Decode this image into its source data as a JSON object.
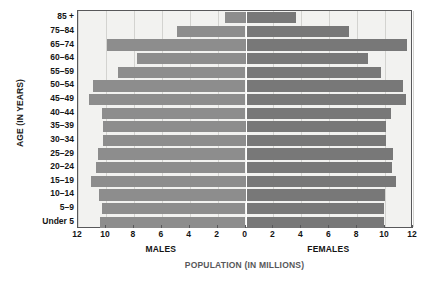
{
  "chart_data": {
    "type": "bar",
    "subtype": "population-pyramid",
    "title": "",
    "xlabel": "POPULATION (IN MILLIONS)",
    "ylabel": "AGE (IN YEARS)",
    "categories": [
      "85 +",
      "75–84",
      "65–74",
      "60–64",
      "55–59",
      "50–54",
      "45–49",
      "40–44",
      "35–39",
      "30–34",
      "25–29",
      "20–24",
      "15–19",
      "10–14",
      "5–9",
      "Under 5"
    ],
    "series": [
      {
        "name": "MALES",
        "direction": "left",
        "color": "#8d8d8d",
        "values": [
          1.5,
          4.9,
          9.9,
          7.8,
          9.1,
          10.9,
          11.2,
          10.3,
          10.2,
          10.2,
          10.6,
          10.7,
          11.1,
          10.5,
          10.3,
          10.4
        ]
      },
      {
        "name": "FEMALES",
        "direction": "right",
        "color": "#787878",
        "values": [
          3.6,
          7.4,
          11.6,
          8.8,
          9.7,
          11.3,
          11.5,
          10.4,
          10.1,
          10.1,
          10.6,
          10.5,
          10.8,
          10.0,
          9.9,
          9.9
        ]
      }
    ],
    "xticks": [
      12,
      10,
      8,
      6,
      4,
      2,
      0,
      2,
      4,
      6,
      8,
      10,
      12
    ],
    "xlim": [
      -12,
      12
    ],
    "xtick_step": 2,
    "grid": true,
    "grid_axis": "x",
    "legend": "none",
    "center_line_color": "#ffffff",
    "plot_background": "#f2f2f0",
    "axis_color": "#58585a",
    "gridline_color": "#d3d3d0"
  }
}
